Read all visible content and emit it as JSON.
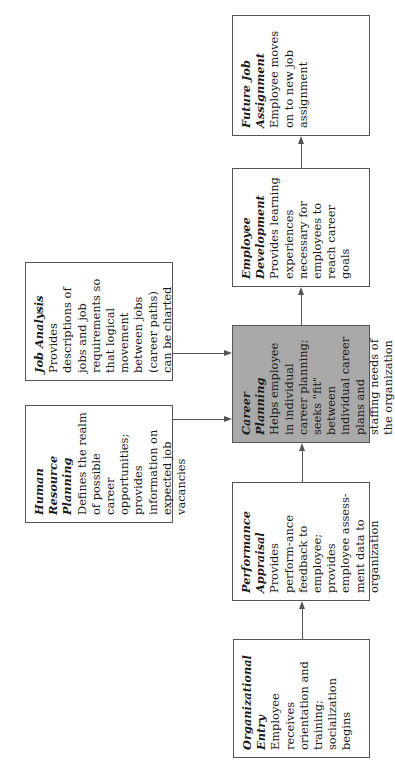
{
  "diagram": {
    "type": "flowchart",
    "orientation": "rotated-90-ccw",
    "highlight_color": "#a9a9a9",
    "boxes": [
      {
        "id": "organizational-entry",
        "title": "Organizational Entry",
        "description": "Employee receives orientation and training; socialization begins"
      },
      {
        "id": "performance-appraisal",
        "title": "Performance Appraisal",
        "description": "Provides perform-ance feedback to employee; provides employee assess-ment data to organization"
      },
      {
        "id": "human-resource-planning",
        "title": "Human Resource Planning",
        "description": "Defines the realm of possible career opportunities; provides information on expected job vacancies"
      },
      {
        "id": "job-analysis",
        "title": "Job Analysis",
        "description": "Provides descriptions of jobs and job requirements so that logical movement between jobs (career paths) can be charted"
      },
      {
        "id": "career-planning",
        "title": "Career Planning",
        "description": "Helps employee in individual career planning; seeks \"fit\" between individual career plans and staffing needs of the organization"
      },
      {
        "id": "employee-development",
        "title": "Employee Development",
        "description": "Provides learning experiences necessary for employees to reach career goals"
      },
      {
        "id": "future-job-assignment",
        "title": "Future Job Assignment",
        "description": "Employee moves on to new job assignment"
      }
    ],
    "connections": [
      {
        "from": "Organizational Entry",
        "to": "Performance Appraisal"
      },
      {
        "from": "Performance Appraisal",
        "to": "Career Planning"
      },
      {
        "from": "Human Resource Planning",
        "to": "Career Planning"
      },
      {
        "from": "Job Analysis",
        "to": "Career Planning"
      },
      {
        "from": "Career Planning",
        "to": "Employee Development"
      },
      {
        "from": "Employee Development",
        "to": "Future Job Assignment"
      }
    ]
  }
}
